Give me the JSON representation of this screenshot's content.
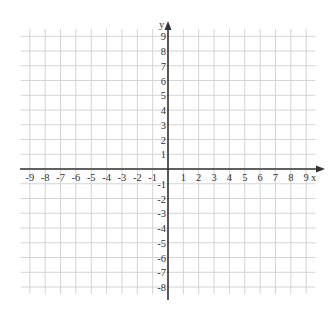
{
  "diagram": {
    "type": "coordinate-plane",
    "x_axis": {
      "label": "x",
      "min": -9,
      "max": 9,
      "tick_labels": [
        "-9",
        "-8",
        "-7",
        "-6",
        "-5",
        "-4",
        "-3",
        "-2",
        "-1",
        "1",
        "2",
        "3",
        "4",
        "5",
        "6",
        "7",
        "8",
        "9"
      ]
    },
    "y_axis": {
      "label": "y",
      "min": -8,
      "max": 9,
      "tick_labels": [
        "9",
        "8",
        "7",
        "6",
        "5",
        "4",
        "3",
        "2",
        "1",
        "-1",
        "-2",
        "-3",
        "-4",
        "-5",
        "-6",
        "-7",
        "-8"
      ]
    },
    "colors": {
      "grid": "#d4d4d4",
      "axis": "#333333",
      "text": "#333333",
      "background": "#ffffff"
    }
  }
}
